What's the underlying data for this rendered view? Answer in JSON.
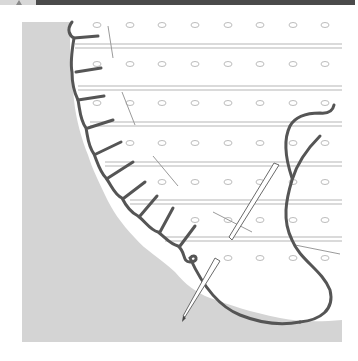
{
  "illustration": {
    "title": "Whip stitch along pleated fabric edge with needle and thread",
    "colors": {
      "background": "#ffffff",
      "panel": "#d4d4d4",
      "fabric": "#ffffff",
      "fabric_lines": "#b5b5b5",
      "holes": "#bdbdbd",
      "thread": "#555555",
      "needle": "#6a6a6a",
      "topbar_dark": "#4a4a4a",
      "topbar_tab": "#d8d8d8"
    },
    "panel": {
      "x": 22,
      "y": 22,
      "width": 320,
      "height": 320
    },
    "fabric_rows_y": [
      46,
      88,
      124,
      164,
      202,
      239
    ],
    "hole_columns_x": [
      97,
      130,
      162,
      195,
      228,
      260,
      293,
      325
    ],
    "hole_rows_y": [
      25,
      62,
      105,
      143,
      182,
      220,
      258
    ],
    "stitch_count": 8,
    "needles": 2
  }
}
